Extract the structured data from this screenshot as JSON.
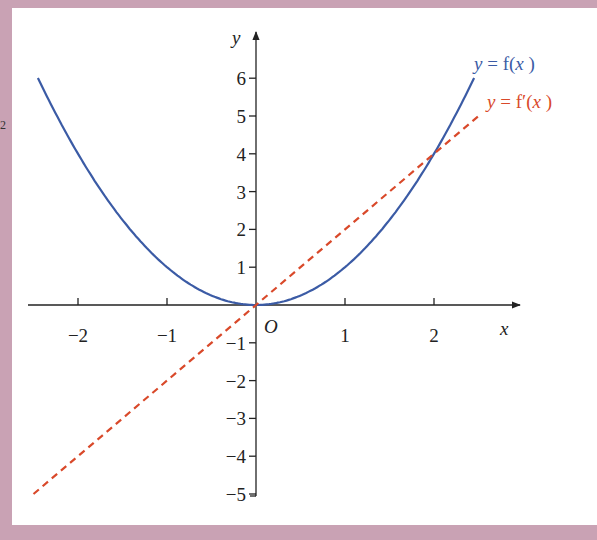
{
  "margin_label": "2",
  "axes": {
    "x_label": "x",
    "y_label": "y",
    "origin_label": "O"
  },
  "legend": {
    "f": "y = f(x )",
    "f_prime": "y = f′(x )"
  },
  "colors": {
    "background": "#c9a2b4",
    "panel": "#ffffff",
    "f_curve": "#3b5ba5",
    "f_prime_line": "#d9492a",
    "axis": "#222222"
  },
  "chart_data": {
    "type": "line",
    "title": "",
    "xlabel": "x",
    "ylabel": "y",
    "xlim": [
      -2.5,
      2.75
    ],
    "ylim": [
      -5,
      6.5
    ],
    "x_ticks": [
      -2,
      -1,
      1,
      2
    ],
    "y_ticks": [
      -5,
      -4,
      -3,
      -2,
      -1,
      1,
      2,
      3,
      4,
      5,
      6
    ],
    "grid": false,
    "legend_position": "top-right inline labels",
    "series": [
      {
        "name": "y = f(x)",
        "style": "solid",
        "color": "#3b5ba5",
        "formula": "x^2",
        "x": [
          -2.45,
          -2,
          -1.5,
          -1,
          -0.5,
          0,
          0.5,
          1,
          1.5,
          2,
          2.45
        ],
        "values": [
          6.0,
          4,
          2.25,
          1,
          0.25,
          0,
          0.25,
          1,
          2.25,
          4,
          6.0
        ]
      },
      {
        "name": "y = f'(x)",
        "style": "dashed",
        "color": "#d9492a",
        "formula": "2x",
        "x": [
          -2.5,
          -2,
          -1,
          0,
          1,
          2,
          2.5
        ],
        "values": [
          -5,
          -4,
          -2,
          0,
          2,
          4,
          5
        ]
      }
    ]
  }
}
